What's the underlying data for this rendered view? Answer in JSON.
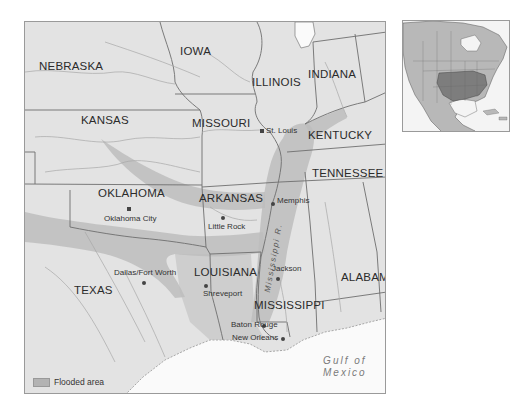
{
  "map": {
    "title": "Flooded area map — Mississippi River basin",
    "states": [
      {
        "name": "NEBRASKA",
        "x": 38,
        "y": 40
      },
      {
        "name": "IOWA",
        "x": 155,
        "y": 25
      },
      {
        "name": "ILLINOIS",
        "x": 225,
        "y": 57
      },
      {
        "name": "INDIANA",
        "x": 305,
        "y": 48
      },
      {
        "name": "KANSAS",
        "x": 56,
        "y": 94
      },
      {
        "name": "MISSOURI",
        "x": 166,
        "y": 98
      },
      {
        "name": "KENTUCKY",
        "x": 287,
        "y": 108
      },
      {
        "name": "TENNESSEE",
        "x": 288,
        "y": 150
      },
      {
        "name": "OKLAHOMA",
        "x": 74,
        "y": 166
      },
      {
        "name": "ARKANSAS",
        "x": 173,
        "y": 171
      },
      {
        "name": "LOUISIANA",
        "x": 168,
        "y": 245
      },
      {
        "name": "ALABAMA",
        "x": 316,
        "y": 250
      },
      {
        "name": "MISSISSIPPI",
        "x": 233,
        "y": 279
      },
      {
        "name": "TEXAS",
        "x": 48,
        "y": 263
      }
    ],
    "cities": [
      {
        "name": "St. Louis",
        "dot_x": 237,
        "dot_y": 109,
        "x": 242,
        "y": 105
      },
      {
        "name": "Memphis",
        "dot_x": 247,
        "dot_y": 182,
        "x": 252,
        "y": 176
      },
      {
        "name": "Oklahoma City",
        "dot_x": 102,
        "dot_y": 186,
        "x": 79,
        "y": 193
      },
      {
        "name": "Little Rock",
        "dot_x": 197,
        "dot_y": 196,
        "x": 182,
        "y": 203
      },
      {
        "name": "Dallas/Fort Worth",
        "dot_x": 117,
        "dot_y": 260,
        "x": 93,
        "y": 248
      },
      {
        "name": "Jackson",
        "dot_x": 251,
        "dot_y": 256,
        "x": 247,
        "y": 244
      },
      {
        "name": "Shreveport",
        "dot_x": 180,
        "dot_y": 264,
        "x": 177,
        "y": 270
      },
      {
        "name": "Baton Rouge",
        "dot_x": 237,
        "dot_y": 304,
        "x": 208,
        "y": 299
      },
      {
        "name": "New Orleans",
        "dot_x": 256,
        "dot_y": 317,
        "x": 206,
        "y": 313
      }
    ],
    "river_label": "Mississippi R.",
    "water_label_line1": "Gulf of",
    "water_label_line2": "Mexico",
    "legend": {
      "label": "Flooded area",
      "swatch_color": "#b3b3b3"
    },
    "colors": {
      "land": "#e3e3e3",
      "flooded": "#bdbdbd",
      "water": "#fafafa",
      "borders": "#6e6e6e",
      "rivers": "#a8a8a8"
    }
  },
  "inset": {
    "label": "North America locator map",
    "highlight_color": "#7d7d7d",
    "land_color": "#b8b8b8"
  }
}
